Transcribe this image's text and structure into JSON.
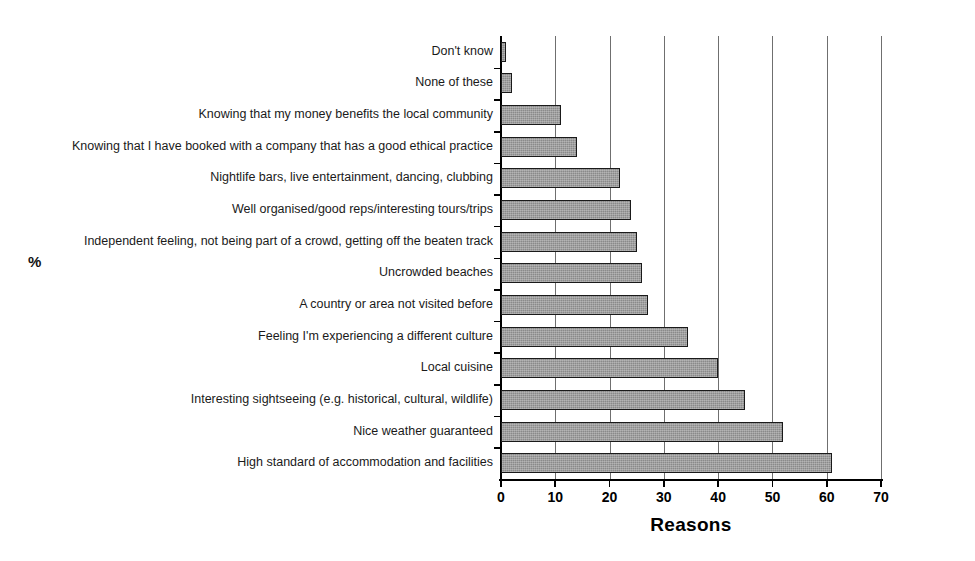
{
  "chart_data": {
    "type": "bar",
    "orientation": "horizontal",
    "title": "",
    "xlabel": "Reasons",
    "ylabel": "%",
    "xlim": [
      0,
      70
    ],
    "xticks": [
      0,
      10,
      20,
      30,
      40,
      50,
      60,
      70
    ],
    "grid": true,
    "gridlines_axis": "x",
    "legend": "none",
    "bar_color": "#8a8a8a",
    "bar_edge_color": "#1a1a1a",
    "categories": [
      "Don't know",
      "None of these",
      "Knowing that my money benefits the local community",
      "Knowing that I have booked with a company that has a good ethical practice",
      "Nightlife bars, live entertainment, dancing, clubbing",
      "Well organised/good reps/interesting tours/trips",
      "Independent feeling, not being part of a crowd, getting off the beaten track",
      "Uncrowded beaches",
      "A country or area not visited before",
      "Feeling I'm experiencing a different culture",
      "Local cuisine",
      "Interesting sightseeing (e.g. historical, cultural, wildlife)",
      "Nice weather guaranteed",
      "High standard of accommodation and facilities"
    ],
    "values": [
      1,
      2,
      11,
      14,
      22,
      24,
      25,
      26,
      27,
      34.5,
      40,
      45,
      52,
      61
    ]
  }
}
